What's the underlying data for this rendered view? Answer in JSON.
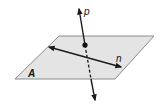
{
  "diagram": {
    "type": "geometry",
    "colors": {
      "plane_fill": "#e4e4e4",
      "plane_edge": "#8c8c8c",
      "line": "#1a1a1a",
      "point": "#111111"
    },
    "plane": {
      "label": "A",
      "corners": [
        [
          59,
          36
        ],
        [
          154,
          36
        ],
        [
          115,
          79
        ],
        [
          15,
          79
        ]
      ]
    },
    "lines": [
      {
        "name": "p",
        "label": "p",
        "from": [
          95,
          100
        ],
        "to": [
          79,
          9
        ],
        "arrows": "both",
        "dashed_segment": "inside-plane-below-point"
      },
      {
        "name": "n",
        "label": "n",
        "from": [
          49,
          47
        ],
        "to": [
          121,
          67
        ],
        "arrows": "both",
        "lies_in_plane": true
      }
    ],
    "intersection_point": {
      "x": 85,
      "y": 45
    }
  }
}
